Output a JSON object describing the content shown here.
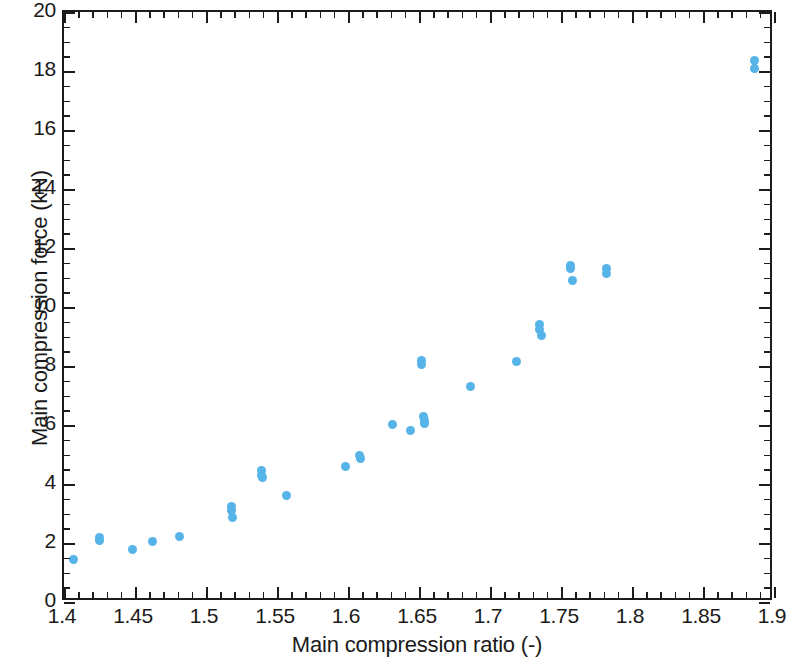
{
  "chart_data": {
    "type": "scatter",
    "title": "",
    "xlabel": "Main compression ratio (-)",
    "ylabel": "Main compression force (kN)",
    "xlim": [
      1.4,
      1.9
    ],
    "ylim": [
      0,
      20
    ],
    "xticks": [
      1.4,
      1.45,
      1.5,
      1.55,
      1.6,
      1.65,
      1.7,
      1.75,
      1.8,
      1.85,
      1.9
    ],
    "xtick_labels": [
      "1.4",
      "1.45",
      "1.5",
      "1.55",
      "1.6",
      "1.65",
      "1.7",
      "1.75",
      "1.8",
      "1.85",
      "1.9"
    ],
    "yticks": [
      0,
      2,
      4,
      6,
      8,
      10,
      12,
      14,
      16,
      18,
      20
    ],
    "ytick_labels": [
      "0",
      "2",
      "4",
      "6",
      "8",
      "10",
      "12",
      "14",
      "16",
      "18",
      "20"
    ],
    "x_minor_per_major": 5,
    "y_minor_per_major": 4,
    "grid": false,
    "legend": null,
    "marker_color": "#56b4e8",
    "marker_size": 9,
    "axis_color": "#1c1c1c",
    "background": "#ffffff",
    "series": [
      {
        "name": "Main compression force",
        "points": [
          [
            1.407,
            1.45
          ],
          [
            1.425,
            2.1
          ],
          [
            1.425,
            2.18
          ],
          [
            1.448,
            1.78
          ],
          [
            1.462,
            2.05
          ],
          [
            1.481,
            2.22
          ],
          [
            1.518,
            3.25
          ],
          [
            1.518,
            3.1
          ],
          [
            1.519,
            2.88
          ],
          [
            1.539,
            4.45
          ],
          [
            1.539,
            4.3
          ],
          [
            1.54,
            4.22
          ],
          [
            1.557,
            3.62
          ],
          [
            1.598,
            4.6
          ],
          [
            1.608,
            4.95
          ],
          [
            1.609,
            4.88
          ],
          [
            1.631,
            6.02
          ],
          [
            1.644,
            5.8
          ],
          [
            1.652,
            8.2
          ],
          [
            1.652,
            8.05
          ],
          [
            1.653,
            6.3
          ],
          [
            1.654,
            6.15
          ],
          [
            1.654,
            6.05
          ],
          [
            1.686,
            7.3
          ],
          [
            1.719,
            8.15
          ],
          [
            1.735,
            9.4
          ],
          [
            1.735,
            9.25
          ],
          [
            1.736,
            9.05
          ],
          [
            1.757,
            11.42
          ],
          [
            1.757,
            11.3
          ],
          [
            1.758,
            10.9
          ],
          [
            1.782,
            11.3
          ],
          [
            1.782,
            11.15
          ],
          [
            1.886,
            18.35
          ],
          [
            1.886,
            18.1
          ]
        ]
      }
    ]
  }
}
